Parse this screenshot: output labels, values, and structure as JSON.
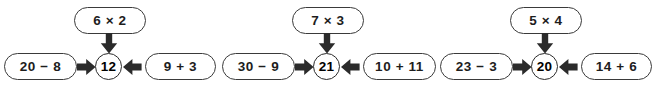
{
  "page": {
    "background_color": "#ffffff",
    "stroke_color": "#3a3a3a",
    "text_color": "#1d1d1d"
  },
  "groups": [
    {
      "id": "bond-1",
      "top_expression": "6 × 2",
      "left_expression": "20 − 8",
      "right_expression": "9 + 3",
      "result": "12",
      "arrows": {
        "down": "arrow-down-icon",
        "left_to_center": "arrow-right-icon",
        "right_to_center": "arrow-left-icon"
      }
    },
    {
      "id": "bond-2",
      "top_expression": "7 × 3",
      "left_expression": "30 − 9",
      "right_expression": "10 + 11",
      "result": "21",
      "arrows": {
        "down": "arrow-down-icon",
        "left_to_center": "arrow-right-icon",
        "right_to_center": "arrow-left-icon"
      }
    },
    {
      "id": "bond-3",
      "top_expression": "5 × 4",
      "left_expression": "23 − 3",
      "right_expression": "14 + 6",
      "result": "20",
      "arrows": {
        "down": "arrow-down-icon",
        "left_to_center": "arrow-right-icon",
        "right_to_center": "arrow-left-icon"
      }
    }
  ]
}
